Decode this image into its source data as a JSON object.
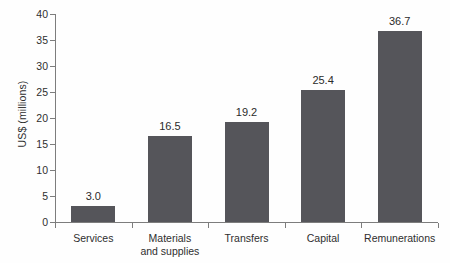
{
  "chart_data": {
    "type": "bar",
    "title": "",
    "subtitle": "",
    "xlabel": "",
    "ylabel": "US$ (millions)",
    "categories": [
      "Services",
      "Materials\nand supplies",
      "Transfers",
      "Capital",
      "Remunerations"
    ],
    "values": [
      3.0,
      16.5,
      19.2,
      25.4,
      36.7
    ],
    "value_labels": [
      "3.0",
      "16.5",
      "19.2",
      "25.4",
      "36.7"
    ],
    "ylim": [
      0,
      40
    ],
    "y_ticks": [
      0,
      5,
      10,
      15,
      20,
      25,
      30,
      35,
      40
    ],
    "y_tick_labels": [
      "0",
      "5",
      "10",
      "15",
      "20",
      "25",
      "30",
      "35",
      "40"
    ],
    "grid": false,
    "legend": null,
    "legend_position": "none",
    "series": [
      {
        "name": "Expenditure",
        "values": [
          3.0,
          16.5,
          19.2,
          25.4,
          36.7
        ],
        "color": "#55555a"
      }
    ],
    "colors": {
      "bar": "#55555a",
      "axis": "#7d7d7d",
      "text": "#2b2b2b",
      "background": "#fefefe"
    }
  }
}
